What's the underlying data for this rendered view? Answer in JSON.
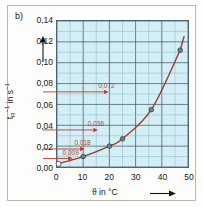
{
  "figure": {
    "panel_label": "b)",
    "background_color": "#fdfdfb",
    "frame_color": "#b9b6ad"
  },
  "chart_data": {
    "type": "scatter",
    "title": "",
    "subtitle": "",
    "xlabel": "ϑ in °C",
    "ylabel": "tᵣ⁻¹ in s⁻¹",
    "xlim": [
      0,
      50
    ],
    "ylim": [
      0,
      0.14
    ],
    "xticks": [
      0,
      10,
      20,
      30,
      40,
      50
    ],
    "xtick_labels": [
      "0",
      "10",
      "20",
      "30",
      "40",
      "50"
    ],
    "yticks": [
      0.0,
      0.02,
      0.04,
      0.06,
      0.08,
      0.1,
      0.12,
      0.14
    ],
    "ytick_labels": [
      "0,00",
      "0,02",
      "0,04",
      "0,06",
      "0,08",
      "0,10",
      "0,12",
      "0,14"
    ],
    "x_minor_step": 5,
    "y_minor_step": 0.01,
    "grid": true,
    "grid_color": "#4a6470",
    "minor_grid_color": "#7fb9c9",
    "plot_background": "#d4eef5",
    "legend": "none",
    "series": [
      {
        "name": "measured points",
        "marker": "circle",
        "marker_color": "#6b7f8c",
        "marker_edge_color": "#2d3e48",
        "curve_color": "#9e3b26",
        "x": [
          0,
          10,
          20,
          25,
          36,
          47
        ],
        "y": [
          0.003,
          0.01,
          0.02,
          0.027,
          0.055,
          0.112
        ]
      }
    ],
    "open_marker": {
      "x": 0,
      "y": 0.003,
      "fill": "#ffffff",
      "edge": "#2d3e48"
    },
    "annotations": [
      {
        "name": "rgt-value-0072",
        "value": 0.072,
        "label": "0,072",
        "label_x": 17.5,
        "color": "#b4442c"
      },
      {
        "name": "rgt-value-0036",
        "value": 0.036,
        "label": "0,036",
        "label_x": 13.5,
        "color": "#b4442c"
      },
      {
        "name": "rgt-value-0018",
        "value": 0.018,
        "label": "0,018",
        "label_x": 8.5,
        "color": "#b4442c"
      },
      {
        "name": "rgt-value-0009",
        "value": 0.009,
        "label": "0,009",
        "label_x": 4.0,
        "color": "#b4442c"
      }
    ],
    "arrow_color": "#c0392b"
  }
}
